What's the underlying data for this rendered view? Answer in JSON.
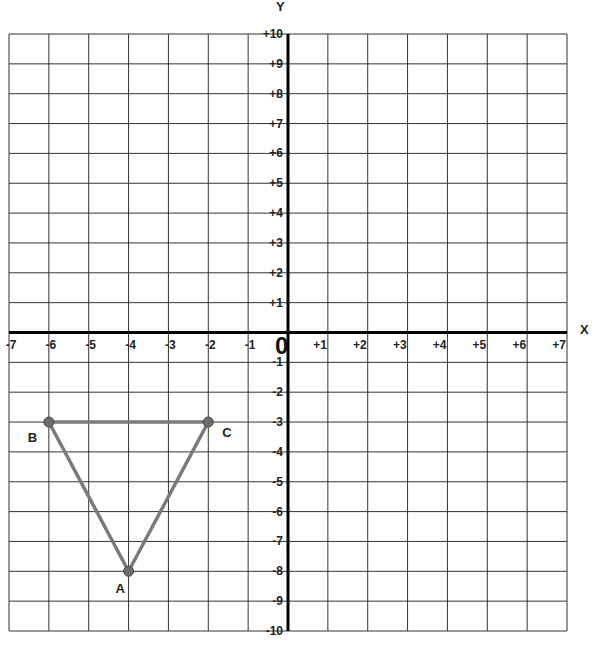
{
  "chart_data": {
    "type": "scatter",
    "title": "",
    "xlabel": "X",
    "ylabel": "Y",
    "origin_label": "0",
    "xlim": [
      -7,
      7
    ],
    "ylim": [
      -10,
      10
    ],
    "grid": true,
    "x_ticks": [
      "-7",
      "-6",
      "-5",
      "-4",
      "-3",
      "-2",
      "-1",
      "+1",
      "+2",
      "+3",
      "+4",
      "+5",
      "+6",
      "+7"
    ],
    "y_ticks": [
      "+10",
      "+9",
      "+8",
      "+7",
      "+6",
      "+5",
      "+4",
      "+3",
      "+2",
      "+1",
      "-1",
      "-2",
      "-3",
      "-4",
      "-5",
      "-6",
      "-7",
      "-8",
      "-9",
      "-10"
    ],
    "points": [
      {
        "label": "A",
        "x": -4,
        "y": -8
      },
      {
        "label": "B",
        "x": -6,
        "y": -3
      },
      {
        "label": "C",
        "x": -2,
        "y": -3
      }
    ],
    "polygon": [
      "B",
      "C",
      "A"
    ],
    "colors": {
      "grid": "#333333",
      "axis": "#000000",
      "shape": "#7a7a7a",
      "point": "#6e6e6e"
    }
  }
}
